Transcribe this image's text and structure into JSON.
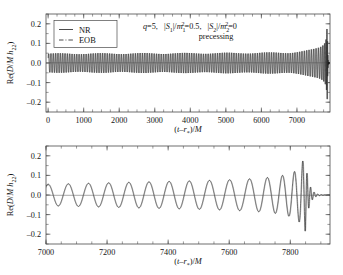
{
  "figure": {
    "background": "#ffffff",
    "ink": "#1a1a1a"
  },
  "panels": {
    "top": {
      "name": "full-waveform-panel",
      "ylabel": "Re(D/M h22)",
      "xlabel": "(t-r*)/M",
      "xticks": [
        0,
        1000,
        2000,
        3000,
        4000,
        5000,
        6000,
        7000
      ],
      "xtick_labels": [
        "0",
        "1000",
        "2000",
        "3000",
        "4000",
        "5000",
        "6000",
        "7000"
      ],
      "yticks": [
        -0.2,
        -0.1,
        0.0,
        0.1,
        0.2
      ],
      "ytick_labels": [
        "-0.2",
        "-0.1",
        "0.0",
        "0.1",
        "0.2"
      ],
      "xlim": [
        -60,
        7930
      ],
      "ylim": [
        -0.25,
        0.25
      ],
      "xminor_step": 250,
      "yminor_step": 0.05
    },
    "bottom": {
      "name": "merger-zoom-panel",
      "ylabel": "Re(D/M h22)",
      "xlabel": "(t-r*)/M",
      "xticks": [
        7000,
        7200,
        7400,
        7600,
        7800
      ],
      "xtick_labels": [
        "7000",
        "7200",
        "7400",
        "7600",
        "7800"
      ],
      "yticks": [
        -0.2,
        -0.1,
        0.0,
        0.1,
        0.2
      ],
      "ytick_labels": [
        "-0.2",
        "-0.1",
        "0.0",
        "0.1",
        "0.2"
      ],
      "xlim": [
        7000,
        7930
      ],
      "ylim": [
        -0.25,
        0.25
      ],
      "xminor_step": 50,
      "yminor_step": 0.05
    }
  },
  "legend": {
    "name": "waveform-legend",
    "entries": [
      {
        "label": "NR",
        "style": "solid",
        "color": "#2b2b2b"
      },
      {
        "label": "EOB",
        "style": "dashdot",
        "color": "#8a8a8a"
      }
    ]
  },
  "annotation": {
    "line1_parts": [
      {
        "text": "q",
        "italic": true
      },
      {
        "text": "=5,",
        "italic": false
      },
      {
        "text": "|S",
        "italic": true
      },
      {
        "text": "1",
        "sub": true
      },
      {
        "text": "|/",
        "italic": true
      },
      {
        "text": "m",
        "italic": true
      },
      {
        "text": "1",
        "sub": true
      },
      {
        "text": "2",
        "sup": true
      },
      {
        "text": "=0.5,",
        "italic": false
      },
      {
        "text": "|S",
        "italic": true
      },
      {
        "text": "2",
        "sub": true
      },
      {
        "text": "|/",
        "italic": true
      },
      {
        "text": "m",
        "italic": true
      },
      {
        "text": "2",
        "sub": true
      },
      {
        "text": "2",
        "sup": true
      },
      {
        "text": "=0",
        "italic": false
      }
    ],
    "line1_plain": "q=5,  |S1|/m1^2=0.5,  |S2|/m2^2=0",
    "line2": "precessing"
  },
  "chart_data": {
    "type": "line",
    "title": "",
    "xlabel": "(t-r*)/M",
    "ylabel": "Re(D/M h22)",
    "grid": false,
    "legend_position": "upper-left",
    "panels": [
      {
        "id": "top",
        "description": "Full inspiral-merger-ringdown gravitational waveform, q=5 precessing binary",
        "xlim": [
          -60,
          7930
        ],
        "ylim": [
          -0.25,
          0.25
        ],
        "series": [
          {
            "name": "NR",
            "style": "solid",
            "color": "#2b2b2b"
          },
          {
            "name": "EOB",
            "style": "dashdot",
            "color": "#8a8a8a"
          }
        ]
      },
      {
        "id": "bottom",
        "description": "Zoom on late inspiral, merger and ringdown from t=7000M",
        "xlim": [
          7000,
          7930
        ],
        "ylim": [
          -0.25,
          0.25
        ],
        "series": [
          {
            "name": "NR",
            "style": "solid",
            "color": "#2b2b2b"
          },
          {
            "name": "EOB",
            "style": "dashdot",
            "color": "#8a8a8a"
          }
        ]
      }
    ],
    "waveform_model": {
      "comment": "Chirp envelope/phase parameters used to reconstruct the plotted h22 signal",
      "t_merger": 7848,
      "t_start": 0,
      "t_end": 7930,
      "amp_peak": 0.193,
      "amp_initial": 0.047,
      "amp_exponent": -0.25,
      "freq_initial_cycles_per_M": 0.01515,
      "freq_merger_cycles_per_M": 0.0575,
      "freq_exponent": -0.375,
      "ringdown_decay_tau": 11.5,
      "ringdown_freq_cycles_per_M": 0.086,
      "phase_offset_rad": -0.95,
      "precession_mod_depth": 0.055,
      "precession_period_M": 1180
    },
    "envelope_samples": {
      "t": [
        0,
        500,
        1000,
        1500,
        2000,
        2500,
        3000,
        3500,
        4000,
        4500,
        5000,
        5500,
        6000,
        6500,
        7000,
        7200,
        7400,
        7600,
        7700,
        7790,
        7830,
        7848,
        7870,
        7890,
        7920
      ],
      "amplitude": [
        0.047,
        0.048,
        0.049,
        0.05,
        0.051,
        0.052,
        0.053,
        0.055,
        0.057,
        0.059,
        0.062,
        0.066,
        0.071,
        0.079,
        0.092,
        0.099,
        0.109,
        0.124,
        0.138,
        0.162,
        0.185,
        0.193,
        0.105,
        0.042,
        0.008
      ]
    },
    "frequency_samples": {
      "t": [
        0,
        1000,
        2000,
        3000,
        4000,
        5000,
        6000,
        6500,
        7000,
        7400,
        7600,
        7750,
        7830,
        7848,
        7900
      ],
      "cycles_per_M": [
        0.01515,
        0.0157,
        0.0163,
        0.0171,
        0.018,
        0.0193,
        0.0212,
        0.0226,
        0.0247,
        0.0285,
        0.032,
        0.039,
        0.052,
        0.0575,
        0.086
      ]
    }
  }
}
